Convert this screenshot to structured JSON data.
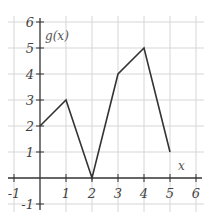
{
  "chart_data": {
    "type": "line",
    "title": "",
    "xlabel": "x",
    "ylabel": "g(x)",
    "xlim": [
      -1,
      6
    ],
    "ylim": [
      -1,
      6
    ],
    "grid": true,
    "x_ticks": [
      -1,
      1,
      2,
      3,
      4,
      5,
      6
    ],
    "y_ticks": [
      -1,
      1,
      2,
      3,
      4,
      5,
      6
    ],
    "x_tick_labels": [
      "-1",
      "1",
      "2",
      "3",
      "4",
      "5",
      "6"
    ],
    "y_tick_labels": [
      "-1",
      "1",
      "2",
      "3",
      "4",
      "5",
      "6"
    ],
    "series": [
      {
        "name": "g(x)",
        "x": [
          0,
          1,
          2,
          3,
          4,
          5
        ],
        "values": [
          2,
          3,
          0,
          4,
          5,
          1
        ]
      }
    ]
  },
  "colors": {
    "grid": "#d6d6d6",
    "axis": "#333333",
    "line": "#333333"
  }
}
